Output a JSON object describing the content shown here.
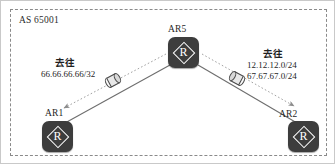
{
  "diagram": {
    "as_label": "AS 65001",
    "nodes": [
      {
        "id": "ar5",
        "label": "AR5",
        "icon": "router-icon",
        "glyph": "R"
      },
      {
        "id": "ar1",
        "label": "AR1",
        "icon": "router-icon",
        "glyph": "R"
      },
      {
        "id": "ar2",
        "label": "AR2",
        "icon": "router-icon",
        "glyph": "R"
      }
    ],
    "annotations": {
      "left": {
        "heading": "去往",
        "routes": [
          "66.66.66.66/32"
        ]
      },
      "right": {
        "heading": "去往",
        "routes": [
          "12.12.12.0/24",
          "67.67.67.0/24"
        ]
      }
    },
    "packets": [
      {
        "id": "packet-left",
        "icon": "packet-icon"
      },
      {
        "id": "packet-right",
        "icon": "packet-icon"
      }
    ],
    "colors": {
      "node_fill": "#3d3d3d",
      "node_glyph": "#ffffff",
      "boundary": "#8a8a8a",
      "link": "#6e6e6e",
      "flow_arrow": "#9a9a9a",
      "background": "#ffffff"
    }
  }
}
